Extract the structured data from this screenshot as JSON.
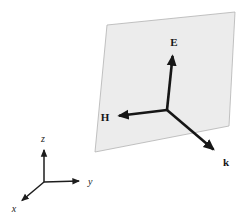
{
  "diagram": {
    "plane": {
      "fill_color": "#ececec",
      "border_color": "#b3b3b3"
    },
    "vectors": [
      {
        "name": "electric-field-vector",
        "label": "E"
      },
      {
        "name": "magnetic-field-vector",
        "label": "H"
      },
      {
        "name": "wave-vector",
        "label": "k"
      }
    ],
    "axes": [
      {
        "name": "z-axis",
        "label": "z"
      },
      {
        "name": "y-axis",
        "label": "y"
      },
      {
        "name": "x-axis",
        "label": "x"
      }
    ],
    "colors": {
      "vector_stroke": "#161616",
      "background": "#ffffff"
    }
  }
}
